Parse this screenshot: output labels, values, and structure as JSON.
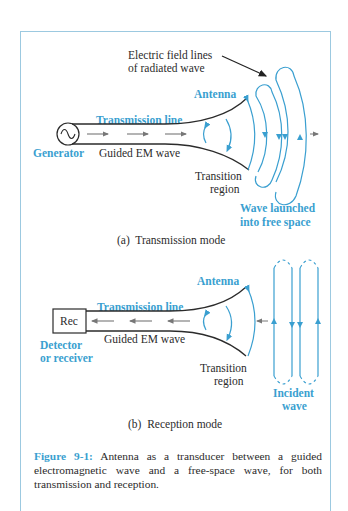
{
  "colors": {
    "accent_blue": "#3a9fd0",
    "line_dark": "#2b2b2b",
    "arrow_gray": "#777777",
    "frame": "#9cc9e0"
  },
  "panel_a": {
    "annotation_field_lines": [
      "Electric field lines",
      "of radiated wave"
    ],
    "antenna_label": "Antenna",
    "transmission_line_label": "Transmission line",
    "generator_label": "Generator",
    "guided_wave_label": "Guided EM wave",
    "transition_label": [
      "Transition",
      "region"
    ],
    "launched_label": [
      "Wave launched",
      "into free space"
    ],
    "subcaption": "(a)  Transmission mode"
  },
  "panel_b": {
    "antenna_label": "Antenna",
    "transmission_line_label": "Transmission line",
    "receiver_box_label": "Rec",
    "detector_label": [
      "Detector",
      "or receiver"
    ],
    "guided_wave_label": "Guided EM wave",
    "transition_label": [
      "Transition",
      "region"
    ],
    "incident_label": [
      "Incident",
      "wave"
    ],
    "subcaption": "(b)  Reception mode"
  },
  "caption": {
    "figure_number": "Figure 9-1:",
    "text": "Antenna as a transducer between a guided electromagnetic wave and a free-space wave, for both transmission and reception."
  },
  "icons": {
    "generator": "ac-source-icon",
    "receiver": "receiver-box-icon"
  }
}
